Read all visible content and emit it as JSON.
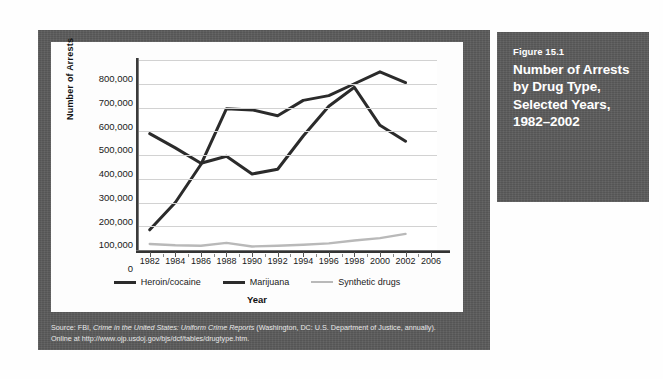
{
  "caption": {
    "figure_number": "Figure 15.1",
    "title": "Number of Arrests by Drug Type, Selected Years, 1982–2002"
  },
  "source": {
    "line1_pre": "Source: FBI, ",
    "line1_italic": "Crime in the United States: Uniform Crime Reports",
    "line1_post": " (Washington, DC: U.S. Department of Justice, annually).",
    "line2": "Online at http://www.ojp.usdoj.gov/bjs/dcf/tables/drugtype.htm."
  },
  "colors": {
    "panel": "#5b5b5b",
    "heroin_cocaine": "#2b2b2b",
    "marijuana": "#2b2b2b",
    "synthetic_drugs": "#b9b9b9",
    "gridline": "#d2d2d2",
    "plot_background": "#ffffff"
  },
  "chart_data": {
    "type": "line",
    "title": "Number of Arrests by Drug Type, Selected Years, 1982–2002",
    "xlabel": "Year",
    "ylabel": "Number of Arrests",
    "grid": true,
    "legend_position": "bottom",
    "x": [
      1982,
      1984,
      1986,
      1988,
      1990,
      1992,
      1994,
      1996,
      1998,
      2000,
      2002
    ],
    "xtick_labels": [
      "1982",
      "1984",
      "1986",
      "1988",
      "1990",
      "1992",
      "1994",
      "1996",
      "1998",
      "2000",
      "2002",
      "2006"
    ],
    "ytick_labels": [
      "0",
      "100,000",
      "200,000",
      "300,000",
      "400,000",
      "500,000",
      "600,000",
      "700,000",
      "800,000"
    ],
    "ylim": [
      0,
      800000
    ],
    "ytick_step": 100000,
    "series": [
      {
        "name": "Heroin/cocaine",
        "color": "#2b2b2b",
        "values": [
          85000,
          200000,
          360000,
          595000,
          590000,
          565000,
          630000,
          650000,
          700000,
          750000,
          705000
        ]
      },
      {
        "name": "Marijuana",
        "color": "#2b2b2b",
        "values": [
          490000,
          430000,
          365000,
          395000,
          320000,
          340000,
          480000,
          605000,
          685000,
          525000,
          458000
        ]
      },
      {
        "name": "Synthetic drugs",
        "color": "#b9b9b9",
        "values": [
          25000,
          20000,
          18000,
          30000,
          15000,
          18000,
          22000,
          28000,
          40000,
          50000,
          68000
        ]
      }
    ]
  }
}
